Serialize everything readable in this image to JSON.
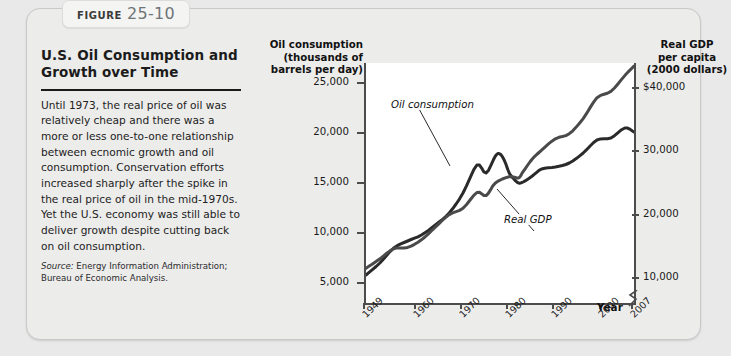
{
  "figure": {
    "badge_word": "Figure",
    "badge_number": "25-10",
    "title": "U.S. Oil Consumption and Growth over Time",
    "body": "Until 1973, the real price of oil was relatively cheap and there was a more or less one-to-one relationship between ecnomic growth and oil consumption. Conservation efforts increased sharply after the spike in the real price of oil in the mid-1970s. Yet the U.S. economy was still able to deliver growth despite cutting back on oil consumption.",
    "source_word": "Source:",
    "source_text": "Energy Information Administration; Bureau of Economic Analysis."
  },
  "chart_data": {
    "type": "line",
    "title": "U.S. Oil Consumption and Growth over Time",
    "xlabel": "Year",
    "ylabel": "Oil consumption (thousands of barrels per day)",
    "y2label": "Real GDP per capita (2000 dollars)",
    "left_axis_title": "Oil consumption\n(thousands of\nbarrels per day)",
    "right_axis_title": "Real GDP\nper capita\n(2000 dollars)",
    "xlim": [
      1949,
      2007
    ],
    "ylim": [
      3000,
      27000
    ],
    "y2lim": [
      6000,
      44000
    ],
    "grid": false,
    "legend_position": "inline-annotations",
    "axis_break_right": true,
    "yticks": [
      5000,
      10000,
      15000,
      20000,
      25000
    ],
    "ytick_labels": [
      "5,000",
      "10,000",
      "15,000",
      "20,000",
      "25,000"
    ],
    "y2ticks": [
      10000,
      20000,
      30000,
      40000
    ],
    "y2tick_labels": [
      "10,000",
      "20,000",
      "30,000",
      "$40,000"
    ],
    "xticks": [
      1949,
      1960,
      1970,
      1980,
      1990,
      2000,
      2007
    ],
    "xtick_labels": [
      "1949",
      "1960",
      "1970",
      "1980",
      "1990",
      "2000",
      "2007"
    ],
    "series": [
      {
        "name": "Oil consumption",
        "axis": "left",
        "x": [
          1949,
          1952,
          1955,
          1958,
          1961,
          1964,
          1967,
          1970,
          1973,
          1975,
          1977,
          1978,
          1979,
          1980,
          1981,
          1982,
          1983,
          1985,
          1987,
          1990,
          1993,
          1996,
          1999,
          2002,
          2005,
          2007
        ],
        "values": [
          5800,
          7000,
          8500,
          9200,
          9800,
          10800,
          12000,
          14000,
          16800,
          16000,
          17700,
          17900,
          17200,
          16000,
          15400,
          15000,
          15100,
          15700,
          16400,
          16600,
          17000,
          18000,
          19300,
          19500,
          20500,
          20100
        ]
      },
      {
        "name": "Real GDP",
        "axis": "right",
        "x": [
          1949,
          1952,
          1955,
          1958,
          1961,
          1964,
          1967,
          1970,
          1973,
          1975,
          1977,
          1980,
          1982,
          1983,
          1985,
          1987,
          1990,
          1993,
          1996,
          1999,
          2002,
          2005,
          2007
        ],
        "values": [
          11500,
          13000,
          14600,
          14800,
          16000,
          18000,
          20000,
          21000,
          23500,
          23000,
          25000,
          26000,
          25800,
          26800,
          28800,
          30200,
          32000,
          32800,
          35200,
          38500,
          39500,
          42000,
          43500
        ]
      }
    ],
    "annotations": [
      {
        "text": "Oil consumption",
        "points_to": "oil-consumption-line"
      },
      {
        "text": "Real GDP",
        "points_to": "real-gdp-line"
      }
    ]
  }
}
